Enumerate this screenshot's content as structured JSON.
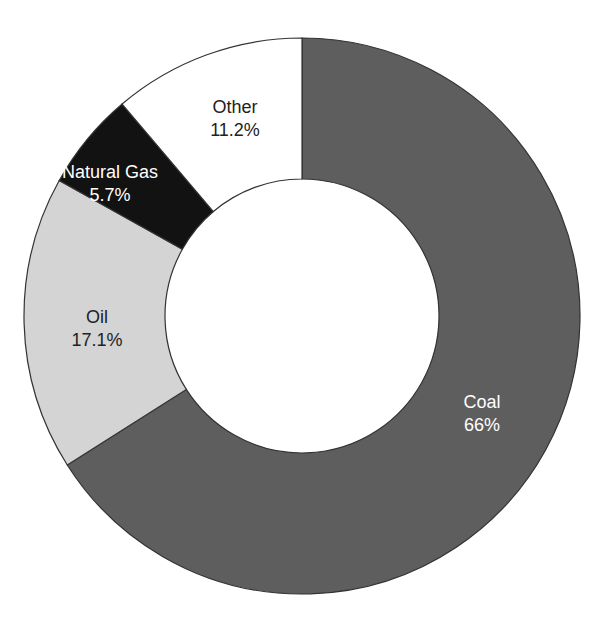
{
  "chart_data": {
    "type": "pie",
    "donut": true,
    "title": "",
    "start_angle_deg": 0,
    "direction": "clockwise",
    "slices": [
      {
        "label": "Coal",
        "value": 66,
        "display": "66%",
        "color": "#5e5e5e",
        "text_color": "#ffffff"
      },
      {
        "label": "Oil",
        "value": 17.1,
        "display": "17.1%",
        "color": "#d4d4d4",
        "text_color": "#222222"
      },
      {
        "label": "Natural Gas",
        "value": 5.7,
        "display": "5.7%",
        "color": "#121212",
        "text_color": "#ffffff"
      },
      {
        "label": "Other",
        "value": 11.2,
        "display": "11.2%",
        "color": "#ffffff",
        "text_color": "#222222"
      }
    ],
    "geometry": {
      "cx": 302,
      "cy": 316,
      "outer_r": 278,
      "inner_r": 137
    },
    "label_positions": [
      {
        "x": 482,
        "y": 408
      },
      {
        "x": 97,
        "y": 323
      },
      {
        "x": 110,
        "y": 178
      },
      {
        "x": 235,
        "y": 113
      }
    ],
    "legend": "none"
  }
}
